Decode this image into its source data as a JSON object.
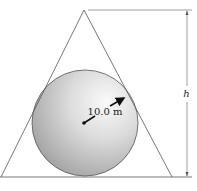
{
  "diagram": {
    "type": "geometry-figure",
    "radius_label": "10.0 m",
    "height_label": "h",
    "colors": {
      "line": "#555555",
      "sphere_light": "#f7f7f7",
      "sphere_mid": "#d2d2d2",
      "sphere_dark": "#8f8f8f",
      "arrow": "#111111"
    }
  }
}
